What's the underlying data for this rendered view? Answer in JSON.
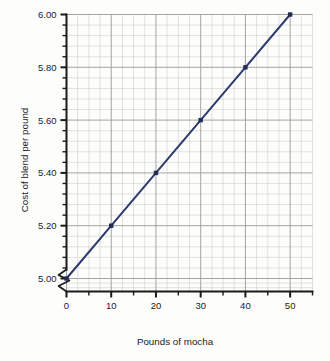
{
  "chart_data": {
    "type": "line",
    "title": "",
    "xlabel": "Pounds of  mocha",
    "ylabel": "Cost of blend per pound",
    "x": [
      0,
      10,
      20,
      30,
      40,
      50
    ],
    "values": [
      5.0,
      5.2,
      5.4,
      5.6,
      5.8,
      6.0
    ],
    "series": [
      {
        "name": "Cost of blend",
        "x": [
          0,
          10,
          20,
          30,
          40,
          50
        ],
        "values": [
          5.0,
          5.2,
          5.4,
          5.6,
          5.8,
          6.0
        ]
      }
    ],
    "xlim": [
      0,
      55
    ],
    "ylim": [
      5.0,
      6.0
    ],
    "x_tick_labels": [
      "0",
      "10",
      "20",
      "30",
      "40",
      "50"
    ],
    "x_tick_values": [
      0,
      10,
      20,
      30,
      40,
      50
    ],
    "x_minor_step": 5,
    "y_tick_labels": [
      "5.00",
      "5.20",
      "5.40",
      "5.60",
      "5.80",
      "6.00"
    ],
    "y_tick_values": [
      5.0,
      5.2,
      5.4,
      5.6,
      5.8,
      6.0
    ],
    "y_minor_step": 0.04,
    "grid": true,
    "legend": "none",
    "y_axis_break": true,
    "marker": "square",
    "line_color": "#2c3a6e",
    "marker_color": "#222c55",
    "grid_major_color": "#9a9a9a",
    "grid_minor_color": "#cfcfcf",
    "axis_color": "#1a1a1a",
    "background_color": "#fdfdfb"
  }
}
